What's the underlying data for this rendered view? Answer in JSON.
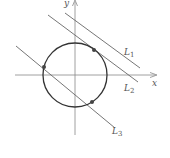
{
  "diagram": {
    "title": "",
    "axes": {
      "x_label": "x",
      "y_label": "y"
    },
    "circle": {
      "cx": 75,
      "cy": 75,
      "r": 32
    },
    "lines": [
      {
        "name": "L1",
        "label_main": "L",
        "label_sub": "1",
        "x1": 65,
        "y1": 13,
        "x2": 140,
        "y2": 68,
        "relation": "does not intersect circle"
      },
      {
        "name": "L2",
        "label_main": "L",
        "label_sub": "2",
        "x1": 48,
        "y1": 15,
        "x2": 138,
        "y2": 82,
        "relation": "tangent to circle"
      },
      {
        "name": "L3",
        "label_main": "L",
        "label_sub": "3",
        "x1": 16,
        "y1": 46,
        "x2": 115,
        "y2": 128,
        "relation": "intersects circle at two points"
      }
    ],
    "points": [
      {
        "name": "tangent-point-L2",
        "x": 94,
        "y": 50
      },
      {
        "name": "intersection-point-L3-upper",
        "x": 44,
        "y": 67
      },
      {
        "name": "intersection-point-L3-lower",
        "x": 92,
        "y": 102
      }
    ],
    "colors": {
      "axis": "#888888",
      "line": "#666666",
      "circle": "#333333",
      "point": "#444444"
    }
  }
}
